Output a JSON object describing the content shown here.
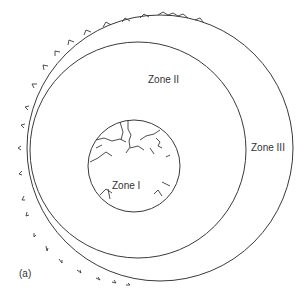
{
  "diagram": {
    "panel_label": "(a)",
    "zones": [
      {
        "id": "zone-1",
        "label": "Zone I"
      },
      {
        "id": "zone-2",
        "label": "Zone II"
      },
      {
        "id": "zone-3",
        "label": "Zone III"
      }
    ],
    "colors": {
      "stroke": "#3a3a3a",
      "text": "#333333",
      "background": "#ffffff"
    }
  }
}
